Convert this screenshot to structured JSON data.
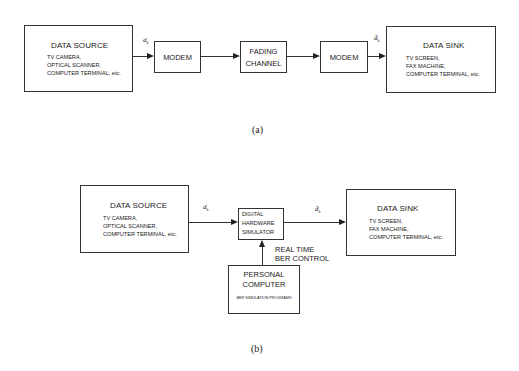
{
  "diagram_a": {
    "caption": "(a)",
    "data_source": {
      "title": "DATA SOURCE",
      "items": [
        "TV CAMERA,",
        "OPTICAL SCANNER,",
        "COMPUTER TERMINAL, etc."
      ]
    },
    "signal_in": {
      "symbol": "d",
      "subscript": "k"
    },
    "modem_tx": {
      "label": "MODEM"
    },
    "channel": {
      "line1": "FADING",
      "line2": "CHANNEL"
    },
    "modem_rx": {
      "label": "MODEM"
    },
    "signal_out": {
      "symbol": "d̂",
      "subscript": "k"
    },
    "data_sink": {
      "title": "DATA SINK",
      "items": [
        "TV SCREEN,",
        "FAX MACHINE,",
        "COMPUTER TERMINAL, etc."
      ]
    }
  },
  "diagram_b": {
    "caption": "(b)",
    "data_source": {
      "title": "DATA SOURCE",
      "items": [
        "TV CAMERA,",
        "OPTICAL SCANNER,",
        "COMPUTER TERMINAL, etc."
      ]
    },
    "signal_in": {
      "symbol": "d",
      "subscript": "k"
    },
    "simulator": {
      "line1": "DIGITAL",
      "line2": "HARDWARE",
      "line3": "SIMULATOR"
    },
    "signal_out": {
      "symbol": "d̂",
      "subscript": "k"
    },
    "data_sink": {
      "title": "DATA SINK",
      "items": [
        "TV SCREEN,",
        "FAX MACHINE,",
        "COMPUTER TERMINAL, etc."
      ]
    },
    "control_label": {
      "line1": "REAL TIME",
      "line2": "BER CONTROL"
    },
    "personal_computer": {
      "line1": "PERSONAL",
      "line2": "COMPUTER",
      "programs": "BER SIMULATION PROGRAMS"
    }
  }
}
